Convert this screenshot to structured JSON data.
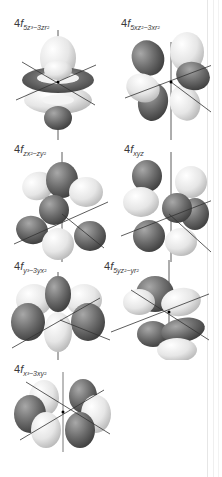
{
  "figure": {
    "orbitals": [
      {
        "id": "5z3-3zr2",
        "principal": "4",
        "letter": "f",
        "subscript": "5z³−3zr²",
        "label_x": 14,
        "label_y": 20
      },
      {
        "id": "5xz2-3xr2",
        "principal": "4",
        "letter": "f",
        "subscript": "5xz²−3xr²",
        "label_x": 121,
        "label_y": 20
      },
      {
        "id": "zx2-zy2",
        "principal": "4",
        "letter": "f",
        "subscript": "zx²−zy²",
        "label_x": 14,
        "label_y": 145
      },
      {
        "id": "xyz",
        "principal": "4",
        "letter": "f",
        "subscript": "xyz",
        "label_x": 124,
        "label_y": 145
      },
      {
        "id": "y3-3yx2",
        "principal": "4",
        "letter": "f",
        "subscript": "y³−3yx²",
        "label_x": 14,
        "label_y": 262
      },
      {
        "id": "5yz2-yr2",
        "principal": "4",
        "letter": "f",
        "subscript": "5yz²−yr²",
        "label_x": 104,
        "label_y": 262
      },
      {
        "id": "x3-3xy2",
        "principal": "4",
        "letter": "f",
        "subscript": "x³−3xy²",
        "label_x": 14,
        "label_y": 365
      }
    ],
    "colors": {
      "positive_lobe": "#e4e4e4",
      "negative_lobe": "#6e6e6e",
      "axis": "#333333",
      "background": "#ffffff"
    }
  }
}
